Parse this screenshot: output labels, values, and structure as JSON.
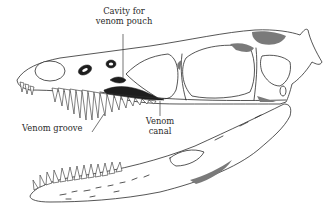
{
  "figure": {
    "colors": {
      "ink": "#2b2b2b",
      "background": "#ffffff",
      "shading": "#7a7a7a"
    },
    "labels": {
      "cavity_line1": "Cavity for",
      "cavity_line2": "venom pouch",
      "groove": "Venom groove",
      "canal_line1": "Venom",
      "canal_line2": "canal"
    }
  }
}
